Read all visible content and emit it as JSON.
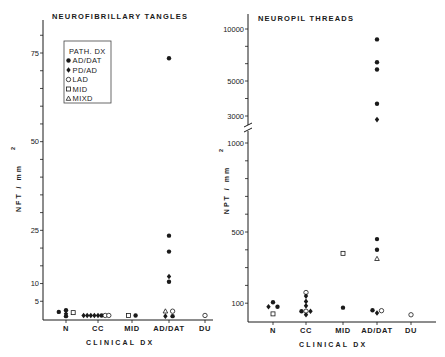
{
  "chart_data": [
    {
      "type": "scatter",
      "title": "NEUROFIBRILLARY TANGLES",
      "xlabel": "CLINICAL DX",
      "ylabel": "NFT / mm",
      "ylabel_superscript": "2",
      "categories": [
        "N",
        "CC",
        "MID",
        "AD/DAT",
        "DU"
      ],
      "yticks_labeled": [
        75,
        50,
        25,
        10,
        5
      ],
      "yticks_minor_step": 5,
      "ylim": [
        0,
        80
      ],
      "legend": {
        "title": "PATH. DX",
        "placement": "top-left",
        "entries": [
          {
            "marker": "filled-circle",
            "label": "AD/DAT"
          },
          {
            "marker": "filled-diamond",
            "label": "PD/AD"
          },
          {
            "marker": "open-circle",
            "label": "LAD"
          },
          {
            "marker": "open-square",
            "label": "MID"
          },
          {
            "marker": "open-triangle",
            "label": "MIXD"
          }
        ]
      },
      "points": [
        {
          "category": "N",
          "offset": -2,
          "value": 2,
          "marker": "filled-circle"
        },
        {
          "category": "N",
          "offset": 0,
          "value": 2.5,
          "marker": "filled-circle"
        },
        {
          "category": "N",
          "offset": 0,
          "value": 1.5,
          "marker": "filled-diamond"
        },
        {
          "category": "N",
          "offset": 0,
          "value": 0.8,
          "marker": "filled-circle"
        },
        {
          "category": "N",
          "offset": 2,
          "value": 1.8,
          "marker": "open-square"
        },
        {
          "category": "CC",
          "offset": -4,
          "value": 1,
          "marker": "filled-diamond"
        },
        {
          "category": "CC",
          "offset": -3,
          "value": 1,
          "marker": "filled-diamond"
        },
        {
          "category": "CC",
          "offset": -2,
          "value": 1,
          "marker": "filled-diamond"
        },
        {
          "category": "CC",
          "offset": -1,
          "value": 1,
          "marker": "filled-diamond"
        },
        {
          "category": "CC",
          "offset": 0,
          "value": 1,
          "marker": "filled-diamond"
        },
        {
          "category": "CC",
          "offset": 1,
          "value": 1,
          "marker": "filled-circle"
        },
        {
          "category": "CC",
          "offset": 2,
          "value": 1,
          "marker": "open-circle"
        },
        {
          "category": "CC",
          "offset": 3,
          "value": 1,
          "marker": "open-circle"
        },
        {
          "category": "MID",
          "offset": -1,
          "value": 1,
          "marker": "open-square"
        },
        {
          "category": "MID",
          "offset": 1,
          "value": 1,
          "marker": "filled-circle"
        },
        {
          "category": "AD/DAT",
          "offset": 0,
          "value": 73.5,
          "marker": "filled-circle"
        },
        {
          "category": "AD/DAT",
          "offset": 0,
          "value": 23.5,
          "marker": "filled-circle"
        },
        {
          "category": "AD/DAT",
          "offset": 0,
          "value": 19,
          "marker": "filled-circle"
        },
        {
          "category": "AD/DAT",
          "offset": 0,
          "value": 12,
          "marker": "filled-diamond"
        },
        {
          "category": "AD/DAT",
          "offset": 0,
          "value": 10.5,
          "marker": "filled-circle"
        },
        {
          "category": "AD/DAT",
          "offset": -1,
          "value": 2.2,
          "marker": "open-triangle"
        },
        {
          "category": "AD/DAT",
          "offset": 1,
          "value": 2.2,
          "marker": "open-circle"
        },
        {
          "category": "AD/DAT",
          "offset": -1,
          "value": 0.8,
          "marker": "filled-diamond"
        },
        {
          "category": "AD/DAT",
          "offset": 1,
          "value": 0.8,
          "marker": "filled-circle"
        },
        {
          "category": "DU",
          "offset": 0,
          "value": 1,
          "marker": "open-circle"
        }
      ]
    },
    {
      "type": "scatter",
      "title": "NEUROPIL THREADS",
      "xlabel": "CLINICAL DX",
      "ylabel": "NPT / mm",
      "ylabel_superscript": "2",
      "categories": [
        "N",
        "CC",
        "MID",
        "AD/DAT",
        "DU"
      ],
      "yticks_labeled": [
        10000,
        5000,
        3000,
        1000,
        500,
        100
      ],
      "axis_break": "between 1000 and 3000",
      "ylim": [
        0,
        10000
      ],
      "points": [
        {
          "category": "N",
          "offset": 0,
          "value": 105,
          "marker": "filled-circle"
        },
        {
          "category": "N",
          "offset": -1,
          "value": 80,
          "marker": "filled-diamond"
        },
        {
          "category": "N",
          "offset": 1,
          "value": 80,
          "marker": "filled-circle"
        },
        {
          "category": "N",
          "offset": 0,
          "value": 40,
          "marker": "open-square"
        },
        {
          "category": "CC",
          "offset": 0,
          "value": 160,
          "marker": "open-circle"
        },
        {
          "category": "CC",
          "offset": 0,
          "value": 140,
          "marker": "filled-diamond"
        },
        {
          "category": "CC",
          "offset": 0,
          "value": 110,
          "marker": "filled-diamond"
        },
        {
          "category": "CC",
          "offset": 0,
          "value": 85,
          "marker": "filled-diamond"
        },
        {
          "category": "CC",
          "offset": -1,
          "value": 55,
          "marker": "filled-circle"
        },
        {
          "category": "CC",
          "offset": 0,
          "value": 55,
          "marker": "open-circle"
        },
        {
          "category": "CC",
          "offset": 1,
          "value": 55,
          "marker": "filled-diamond"
        },
        {
          "category": "CC",
          "offset": 0,
          "value": 35,
          "marker": "filled-diamond"
        },
        {
          "category": "MID",
          "offset": 0,
          "value": 380,
          "marker": "open-square"
        },
        {
          "category": "MID",
          "offset": 0,
          "value": 75,
          "marker": "filled-circle"
        },
        {
          "category": "AD/DAT",
          "offset": 0,
          "value": 9000,
          "marker": "filled-circle"
        },
        {
          "category": "AD/DAT",
          "offset": 0,
          "value": 6800,
          "marker": "filled-circle"
        },
        {
          "category": "AD/DAT",
          "offset": 0,
          "value": 6100,
          "marker": "filled-circle"
        },
        {
          "category": "AD/DAT",
          "offset": 0,
          "value": 3700,
          "marker": "filled-circle"
        },
        {
          "category": "AD/DAT",
          "offset": 0,
          "value": 2800,
          "marker": "filled-diamond"
        },
        {
          "category": "AD/DAT",
          "offset": 0,
          "value": 460,
          "marker": "filled-circle"
        },
        {
          "category": "AD/DAT",
          "offset": 0,
          "value": 400,
          "marker": "filled-circle"
        },
        {
          "category": "AD/DAT",
          "offset": 0,
          "value": 350,
          "marker": "open-triangle"
        },
        {
          "category": "AD/DAT",
          "offset": -1,
          "value": 60,
          "marker": "filled-circle"
        },
        {
          "category": "AD/DAT",
          "offset": 1,
          "value": 58,
          "marker": "open-circle"
        },
        {
          "category": "AD/DAT",
          "offset": 0,
          "value": 45,
          "marker": "filled-diamond"
        },
        {
          "category": "DU",
          "offset": 0,
          "value": 35,
          "marker": "open-circle"
        }
      ]
    }
  ]
}
